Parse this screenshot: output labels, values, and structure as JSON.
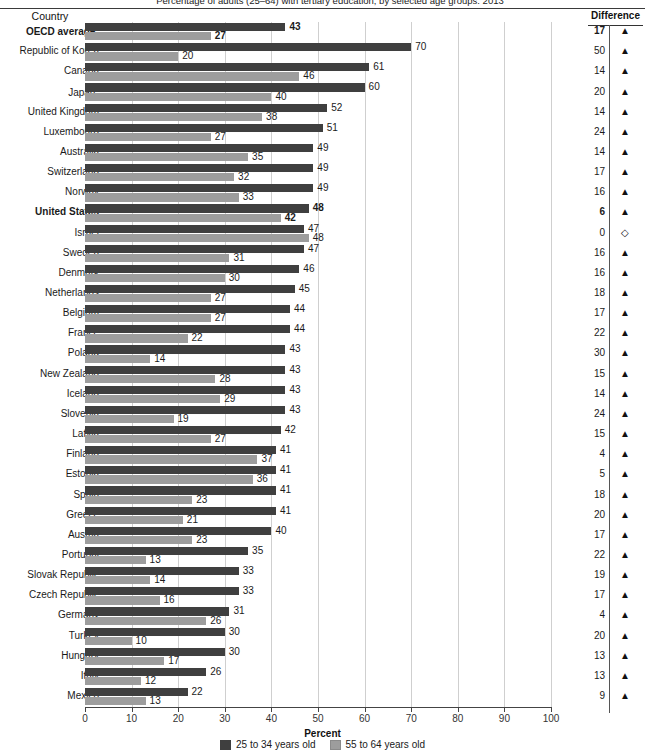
{
  "header": {
    "title_clipped": "Percentage of adults (25–64) with tertiary education, by selected age groups: 2013",
    "country_column": "Country",
    "difference_column": "Difference"
  },
  "axis": {
    "xlabel": "Percent",
    "ticks": [
      "0",
      "10",
      "20",
      "30",
      "40",
      "50",
      "60",
      "70",
      "80",
      "90",
      "100"
    ]
  },
  "legend": {
    "items": [
      {
        "label": "25 to 34 years old",
        "color": "#3f3f3f",
        "key": "young"
      },
      {
        "label": "55 to 64 years old",
        "color": "#9d9d9d",
        "key": "old"
      }
    ]
  },
  "markers": {
    "up": "▲",
    "zero": "◇"
  },
  "chart_data": {
    "type": "bar",
    "orientation": "horizontal",
    "title": "Percentage of adults (25–64) with tertiary education, by selected age groups: 2013",
    "xlabel": "Percent",
    "ylabel": "Country",
    "xlim": [
      0,
      100
    ],
    "xticks": [
      0,
      10,
      20,
      30,
      40,
      50,
      60,
      70,
      80,
      90,
      100
    ],
    "grid": true,
    "legend_position": "bottom",
    "series": [
      {
        "name": "25 to 34 years old",
        "color": "#3f3f3f",
        "values": [
          43,
          70,
          61,
          60,
          52,
          51,
          49,
          49,
          49,
          48,
          47,
          47,
          46,
          45,
          44,
          44,
          43,
          43,
          43,
          43,
          42,
          41,
          41,
          41,
          41,
          40,
          35,
          33,
          33,
          31,
          30,
          30,
          26,
          22
        ]
      },
      {
        "name": "55 to 64 years old",
        "color": "#9d9d9d",
        "values": [
          27,
          20,
          46,
          40,
          38,
          27,
          35,
          32,
          33,
          42,
          48,
          31,
          30,
          27,
          27,
          22,
          14,
          28,
          29,
          19,
          27,
          37,
          36,
          23,
          21,
          23,
          13,
          14,
          16,
          26,
          10,
          17,
          12,
          13
        ]
      }
    ],
    "categories": [
      "OECD average",
      "Republic of Korea",
      "Canada",
      "Japan",
      "United Kingdom",
      "Luxembourg",
      "Australia",
      "Switzerland",
      "Norway",
      "United States",
      "Israel",
      "Sweden",
      "Denmark",
      "Netherlands",
      "Belgium",
      "France",
      "Poland",
      "New Zealand",
      "Iceland",
      "Slovenia",
      "Latvia",
      "Finland",
      "Estonia",
      "Spain",
      "Greece",
      "Austria",
      "Portugal",
      "Slovak Republic",
      "Czech Republic",
      "Germany",
      "Turkey",
      "Hungary",
      "Italy",
      "Mexico"
    ],
    "difference": [
      17,
      50,
      14,
      20,
      14,
      24,
      14,
      17,
      16,
      6,
      0,
      16,
      16,
      18,
      17,
      22,
      30,
      15,
      14,
      24,
      15,
      4,
      5,
      18,
      20,
      17,
      22,
      19,
      17,
      4,
      20,
      13,
      13,
      9
    ]
  },
  "rows": [
    {
      "country": "OECD average",
      "footnote": "1",
      "bold": true,
      "young": 43,
      "old": 27,
      "diff": 17,
      "marker": "up"
    },
    {
      "country": "Republic of Korea",
      "footnote": "",
      "bold": false,
      "young": 70,
      "old": 20,
      "diff": 50,
      "marker": "up"
    },
    {
      "country": "Canada",
      "footnote": "",
      "bold": false,
      "young": 61,
      "old": 46,
      "diff": 14,
      "marker": "up"
    },
    {
      "country": "Japan",
      "footnote": "2",
      "bold": false,
      "young": 60,
      "old": 40,
      "diff": 20,
      "marker": "up"
    },
    {
      "country": "United Kingdom",
      "footnote": "",
      "bold": false,
      "young": 52,
      "old": 38,
      "diff": 14,
      "marker": "up"
    },
    {
      "country": "Luxembourg",
      "footnote": "",
      "bold": false,
      "young": 51,
      "old": 27,
      "diff": 24,
      "marker": "up"
    },
    {
      "country": "Australia",
      "footnote": "",
      "bold": false,
      "young": 49,
      "old": 35,
      "diff": 14,
      "marker": "up"
    },
    {
      "country": "Switzerland",
      "footnote": "",
      "bold": false,
      "young": 49,
      "old": 32,
      "diff": 17,
      "marker": "up"
    },
    {
      "country": "Norway",
      "footnote": "",
      "bold": false,
      "young": 49,
      "old": 33,
      "diff": 16,
      "marker": "up"
    },
    {
      "country": "United States",
      "footnote": "",
      "bold": true,
      "young": 48,
      "old": 42,
      "diff": 6,
      "marker": "up"
    },
    {
      "country": "Israel",
      "footnote": "",
      "bold": false,
      "young": 47,
      "old": 48,
      "diff": 0,
      "marker": "zero"
    },
    {
      "country": "Sweden",
      "footnote": "",
      "bold": false,
      "young": 47,
      "old": 31,
      "diff": 16,
      "marker": "up"
    },
    {
      "country": "Denmark",
      "footnote": "",
      "bold": false,
      "young": 46,
      "old": 30,
      "diff": 16,
      "marker": "up"
    },
    {
      "country": "Netherlands",
      "footnote": "",
      "bold": false,
      "young": 45,
      "old": 27,
      "diff": 18,
      "marker": "up"
    },
    {
      "country": "Belgium",
      "footnote": "",
      "bold": false,
      "young": 44,
      "old": 27,
      "diff": 17,
      "marker": "up"
    },
    {
      "country": "France",
      "footnote": "",
      "bold": false,
      "young": 44,
      "old": 22,
      "diff": 22,
      "marker": "up"
    },
    {
      "country": "Poland",
      "footnote": "",
      "bold": false,
      "young": 43,
      "old": 14,
      "diff": 30,
      "marker": "up"
    },
    {
      "country": "New Zealand",
      "footnote": "",
      "bold": false,
      "young": 43,
      "old": 28,
      "diff": 15,
      "marker": "up"
    },
    {
      "country": "Iceland",
      "footnote": "",
      "bold": false,
      "young": 43,
      "old": 29,
      "diff": 14,
      "marker": "up"
    },
    {
      "country": "Slovenia",
      "footnote": "",
      "bold": false,
      "young": 43,
      "old": 19,
      "diff": 24,
      "marker": "up"
    },
    {
      "country": "Latvia",
      "footnote": "",
      "bold": false,
      "young": 42,
      "old": 27,
      "diff": 15,
      "marker": "up"
    },
    {
      "country": "Finland",
      "footnote": "",
      "bold": false,
      "young": 41,
      "old": 37,
      "diff": 4,
      "marker": "up"
    },
    {
      "country": "Estonia",
      "footnote": "",
      "bold": false,
      "young": 41,
      "old": 36,
      "diff": 5,
      "marker": "up"
    },
    {
      "country": "Spain",
      "footnote": "",
      "bold": false,
      "young": 41,
      "old": 23,
      "diff": 18,
      "marker": "up"
    },
    {
      "country": "Greece",
      "footnote": "",
      "bold": false,
      "young": 41,
      "old": 21,
      "diff": 20,
      "marker": "up"
    },
    {
      "country": "Austria",
      "footnote": "",
      "bold": false,
      "young": 40,
      "old": 23,
      "diff": 17,
      "marker": "up"
    },
    {
      "country": "Portugal",
      "footnote": "",
      "bold": false,
      "young": 35,
      "old": 13,
      "diff": 22,
      "marker": "up"
    },
    {
      "country": "Slovak Republic",
      "footnote": "",
      "bold": false,
      "young": 33,
      "old": 14,
      "diff": 19,
      "marker": "up"
    },
    {
      "country": "Czech Republic",
      "footnote": "",
      "bold": false,
      "young": 33,
      "old": 16,
      "diff": 17,
      "marker": "up"
    },
    {
      "country": "Germany",
      "footnote": "",
      "bold": false,
      "young": 31,
      "old": 26,
      "diff": 4,
      "marker": "up"
    },
    {
      "country": "Turkey",
      "footnote": "",
      "bold": false,
      "young": 30,
      "old": 10,
      "diff": 20,
      "marker": "up"
    },
    {
      "country": "Hungary",
      "footnote": "",
      "bold": false,
      "young": 30,
      "old": 17,
      "diff": 13,
      "marker": "up"
    },
    {
      "country": "Italy",
      "footnote": "",
      "bold": false,
      "young": 26,
      "old": 12,
      "diff": 13,
      "marker": "up"
    },
    {
      "country": "Mexico",
      "footnote": "",
      "bold": false,
      "young": 22,
      "old": 13,
      "diff": 9,
      "marker": "up"
    }
  ]
}
